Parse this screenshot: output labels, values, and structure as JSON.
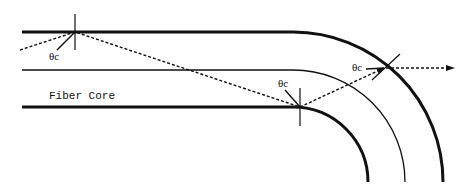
{
  "diagram": {
    "title": "",
    "labels": {
      "fiber_core": "Fiber Core",
      "angle_1": "θc",
      "angle_2": "θc",
      "angle_3": "θc"
    },
    "elements": {
      "outer_cladding_boundary": "thick line (top) bending downward",
      "core_axis": "thin center line bending downward",
      "inner_cladding_boundary": "thick line (bottom) bending downward",
      "ray": "dashed light ray reflecting at critical angle then escaping at bend",
      "escaped_ray_arrow": "dashed arrow pointing right"
    },
    "colors": {
      "line": "#111111",
      "background": "#ffffff"
    }
  }
}
